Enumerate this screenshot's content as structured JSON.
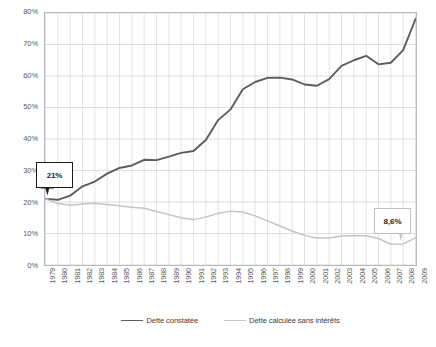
{
  "chart_data": {
    "type": "line",
    "title": "",
    "xlabel": "",
    "ylabel": "",
    "ylim": [
      0,
      80
    ],
    "ytick_step": 10,
    "ytick_labels": [
      "0%",
      "10%",
      "20%",
      "30%",
      "40%",
      "50%",
      "60%",
      "70%",
      "80%"
    ],
    "grid": true,
    "legend_position": "bottom",
    "categories": [
      "1979",
      "1980",
      "1981",
      "1982",
      "1983",
      "1984",
      "1985",
      "1986",
      "1987",
      "1988",
      "1989",
      "1990",
      "1991",
      "1992",
      "1993",
      "1994",
      "1995",
      "1996",
      "1997",
      "1998",
      "1999",
      "2000",
      "2001",
      "2002",
      "2003",
      "2004",
      "2005",
      "2006",
      "2007",
      "2008",
      "2009"
    ],
    "series": [
      {
        "name": "Dette constatée",
        "color": "#5c5c5c",
        "values": [
          21.0,
          20.7,
          22.0,
          25.0,
          26.5,
          29.0,
          30.8,
          31.6,
          33.4,
          33.3,
          34.4,
          35.6,
          36.2,
          39.7,
          46.0,
          49.4,
          55.8,
          58.1,
          59.4,
          59.5,
          58.9,
          57.3,
          56.9,
          59.0,
          63.2,
          65.0,
          66.4,
          63.7,
          64.2,
          68.2,
          78.1
        ]
      },
      {
        "name": "Dette calculée sans intérêts",
        "color": "#c4c4c4",
        "values": [
          21.0,
          19.5,
          19.0,
          19.4,
          19.6,
          19.2,
          18.8,
          18.3,
          18.0,
          17.0,
          16.0,
          15.0,
          14.4,
          15.2,
          16.4,
          17.1,
          16.8,
          15.6,
          14.0,
          12.4,
          10.8,
          9.4,
          8.6,
          8.6,
          9.2,
          9.4,
          9.3,
          8.4,
          6.6,
          6.7,
          8.6
        ]
      }
    ],
    "annotations": [
      {
        "label": "21%",
        "series": "Dette constatée",
        "category": "1979"
      },
      {
        "label": "8,6%",
        "series": "Dette calculée sans intérêts",
        "category": "2009"
      }
    ]
  },
  "legend": {
    "entries": [
      {
        "label": "Dette constatée",
        "color": "#5c5c5c"
      },
      {
        "label": "Dette calculée sans intérêts",
        "color": "#c4c4c4"
      }
    ]
  }
}
